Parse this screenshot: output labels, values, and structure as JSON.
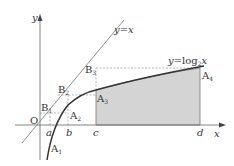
{
  "diagram": {
    "axes": {
      "origin_label": "O",
      "x_label": "x",
      "y_label": "y"
    },
    "curves": {
      "line_label": "y=x",
      "log_label": "y=log",
      "log_base": "2",
      "log_var": "x"
    },
    "x_ticks": [
      "a",
      "b",
      "c",
      "d"
    ],
    "points": {
      "A1": {
        "letter": "A",
        "sub": "1"
      },
      "A2": {
        "letter": "A",
        "sub": "2"
      },
      "A3": {
        "letter": "A",
        "sub": "3"
      },
      "A4": {
        "letter": "A",
        "sub": "4"
      },
      "B1": {
        "letter": "B",
        "sub": "1"
      },
      "B2": {
        "letter": "B",
        "sub": "2"
      },
      "B3": {
        "letter": "B",
        "sub": "3"
      }
    },
    "colors": {
      "shade": "#d4d4d4",
      "curve": "#333333",
      "line": "#777777",
      "axis": "#666666",
      "dashed": "#888888"
    }
  }
}
